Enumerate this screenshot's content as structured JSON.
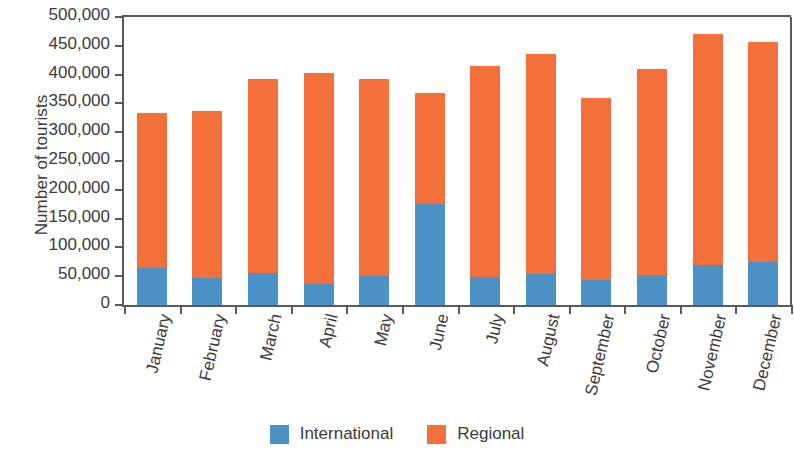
{
  "chart_data": {
    "type": "bar",
    "subtype": "stacked-vertical-bar",
    "title": "",
    "xlabel": "",
    "ylabel": "Number of tourists",
    "ylim": [
      0,
      500000
    ],
    "ytick_step": 50000,
    "ytick_labels": [
      "500,000",
      "450,000",
      "400,000",
      "350,000",
      "300,000",
      "250,000",
      "200,000",
      "150,000",
      "100,000",
      "50,000",
      "0"
    ],
    "ytick_values": [
      500000,
      450000,
      400000,
      350000,
      300000,
      250000,
      200000,
      150000,
      100000,
      50000,
      0
    ],
    "grid": false,
    "legend_position": "bottom-center",
    "categories": [
      "January",
      "February",
      "March",
      "April",
      "May",
      "June",
      "July",
      "August",
      "September",
      "October",
      "November",
      "December"
    ],
    "series": [
      {
        "name": "International",
        "color": "#4B91C6",
        "values": [
          65000,
          47000,
          55000,
          37000,
          50000,
          175000,
          48000,
          53000,
          43000,
          52000,
          70000,
          75000
        ]
      },
      {
        "name": "Regional",
        "color": "#F4703A",
        "values": [
          268000,
          290000,
          338000,
          366000,
          343000,
          193000,
          367000,
          382000,
          316000,
          358000,
          400000,
          382000
        ]
      }
    ],
    "totals": [
      333000,
      337000,
      393000,
      403000,
      393000,
      368000,
      415000,
      435000,
      359000,
      410000,
      470000,
      457000
    ]
  },
  "legend": {
    "items": [
      {
        "label": "International",
        "color": "#4B91C6"
      },
      {
        "label": "Regional",
        "color": "#F4703A"
      }
    ]
  },
  "colors": {
    "international": "#4B91C6",
    "regional": "#F4703A",
    "axis": "#5a5a5a",
    "text": "#3b3b3b",
    "background": "#ffffff"
  }
}
